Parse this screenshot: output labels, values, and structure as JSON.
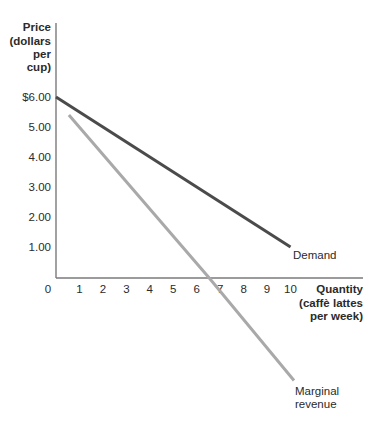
{
  "chart_data": {
    "type": "line",
    "title": "",
    "ylabel_lines": [
      "Price",
      "(dollars",
      "per",
      "cup)"
    ],
    "xlabel_lines": [
      "Quantity",
      "(caffè lattes",
      "per week)"
    ],
    "ylabel": "Price (dollars per cup)",
    "xlabel": "Quantity (caffè lattes per week)",
    "x_ticks": [
      "0",
      "1",
      "2",
      "3",
      "4",
      "5",
      "6",
      "7",
      "8",
      "9",
      "10"
    ],
    "y_ticks": [
      {
        "value": 6,
        "label": "$6.00"
      },
      {
        "value": 5,
        "label": "5.00"
      },
      {
        "value": 4,
        "label": "4.00"
      },
      {
        "value": 3,
        "label": "3.00"
      },
      {
        "value": 2,
        "label": "2.00"
      },
      {
        "value": 1,
        "label": "1.00"
      }
    ],
    "xlim": [
      0,
      13.1
    ],
    "ylim": [
      -3.6,
      8.5
    ],
    "grid": false,
    "legend": "inline labels at line ends",
    "series": [
      {
        "name": "Demand",
        "color": "#4b4b4b",
        "points": [
          {
            "x": 0,
            "y": 6.0
          },
          {
            "x": 10,
            "y": 1.0
          }
        ]
      },
      {
        "name": "Marginal revenue",
        "label_lines": [
          "Marginal",
          "revenue"
        ],
        "color": "#a9a9a9",
        "points": [
          {
            "x": 0.55,
            "y": 5.4
          },
          {
            "x": 6.5,
            "y": 0
          },
          {
            "x": 10.15,
            "y": -3.45
          }
        ]
      }
    ]
  }
}
